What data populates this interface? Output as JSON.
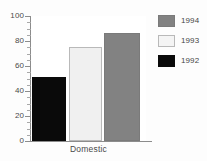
{
  "chart_data": {
    "type": "bar",
    "title": "",
    "subtitle": "",
    "xlabel": "Domestic",
    "ylabel": "",
    "categories": [
      "Domestic"
    ],
    "series": [
      {
        "name": "1992",
        "values": [
          51
        ],
        "color": "#0a0a0a"
      },
      {
        "name": "1993",
        "values": [
          75
        ],
        "color": "#f0f0f0"
      },
      {
        "name": "1994",
        "values": [
          86
        ],
        "color": "#828282"
      }
    ],
    "ylim": [
      0,
      100
    ],
    "yticks": [
      0,
      20,
      40,
      60,
      80,
      100
    ],
    "ytick_labels": [
      "0",
      "20",
      "40",
      "60",
      "80",
      "100"
    ],
    "minor_ticks": true,
    "grid": false,
    "legend_position": "right",
    "legend_order": [
      "1994",
      "1993",
      "1992"
    ]
  },
  "axis": {
    "y": {
      "labels": [
        "100",
        "80",
        "60",
        "40",
        "20",
        "0"
      ]
    },
    "x": {
      "label": "Domestic"
    }
  },
  "legend": {
    "items": [
      {
        "label": "1994",
        "swatch": "legend-swatch-1994"
      },
      {
        "label": "1993",
        "swatch": "legend-swatch-1993"
      },
      {
        "label": "1992",
        "swatch": "legend-swatch-1992"
      }
    ]
  },
  "colors": {
    "bar_1992": "#0a0a0a",
    "bar_1993": "#f0f0f0",
    "bar_1994": "#828282",
    "axis": "#8c8c8c",
    "background": "#fdfdfd",
    "plot_background": "#ffffff",
    "text": "#4a4a4a"
  }
}
